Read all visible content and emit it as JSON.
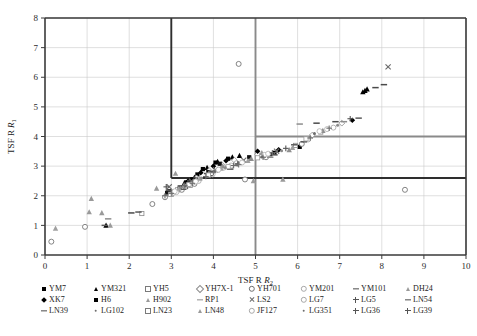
{
  "chart_data": {
    "type": "scatter",
    "title": "",
    "xlabel": "TSF R",
    "xlabel_sub": "2",
    "ylabel": "TSF R",
    "ylabel_sub": "1",
    "xlim": [
      0,
      10
    ],
    "ylim": [
      0,
      8
    ],
    "xticks": [
      "0",
      "1",
      "2",
      "3",
      "4",
      "5",
      "6",
      "7",
      "8",
      "9",
      "10"
    ],
    "yticks": [
      "0",
      "1",
      "2",
      "3",
      "4",
      "5",
      "6",
      "7",
      "8"
    ],
    "grid": true,
    "legend_position": "below",
    "reference_lines": {
      "inner_box_x": 3,
      "inner_box_y": 2.6,
      "outer_box_x": 5,
      "outer_box_y": 4
    },
    "series": [
      {
        "name": "YM7",
        "marker": "square-filled",
        "color": "#000000",
        "points": [
          [
            3.5,
            2.55
          ],
          [
            3.62,
            2.72
          ],
          [
            3.75,
            2.9
          ],
          [
            4.05,
            3.12
          ],
          [
            4.35,
            3.25
          ],
          [
            2.95,
            2.15
          ],
          [
            5.45,
            3.45
          ],
          [
            6.05,
            3.65
          ],
          [
            3.35,
            2.45
          ]
        ]
      },
      {
        "name": "YM321",
        "marker": "triangle-filled",
        "color": "#000000",
        "points": [
          [
            1.45,
            1.0
          ],
          [
            3.3,
            2.4
          ],
          [
            3.55,
            2.62
          ],
          [
            3.85,
            2.95
          ],
          [
            4.1,
            3.15
          ],
          [
            4.45,
            3.3
          ],
          [
            4.62,
            3.35
          ],
          [
            7.55,
            5.5
          ],
          [
            7.6,
            5.55
          ],
          [
            7.65,
            5.6
          ]
        ]
      },
      {
        "name": "YH5",
        "marker": "square-open",
        "color": "#8a8a8a",
        "points": [
          [
            2.3,
            1.4
          ],
          [
            3.0,
            2.05
          ],
          [
            3.45,
            2.35
          ],
          [
            5.95,
            3.7
          ],
          [
            6.55,
            4.15
          ],
          [
            3.15,
            2.2
          ]
        ]
      },
      {
        "name": "YH7X-1",
        "marker": "diamond-open",
        "color": "#8c8c8c",
        "points": [
          [
            3.6,
            2.6
          ],
          [
            3.9,
            2.85
          ],
          [
            4.2,
            3.05
          ],
          [
            4.5,
            3.2
          ],
          [
            5.05,
            3.4
          ],
          [
            7.05,
            4.45
          ],
          [
            6.35,
            4.05
          ]
        ]
      },
      {
        "name": "YH701",
        "marker": "circle-open",
        "color": "#6f6f6f",
        "points": [
          [
            0.95,
            0.95
          ],
          [
            2.55,
            1.72
          ],
          [
            2.85,
            1.95
          ],
          [
            3.25,
            2.2
          ],
          [
            3.55,
            2.4
          ],
          [
            4.6,
            6.45
          ],
          [
            4.75,
            2.55
          ],
          [
            5.25,
            3.3
          ],
          [
            6.1,
            3.75
          ],
          [
            8.55,
            2.2
          ],
          [
            0.15,
            0.45
          ]
        ]
      },
      {
        "name": "YM201",
        "marker": "circle-light",
        "color": "#a8a8a8",
        "points": [
          [
            3.05,
            2.1
          ],
          [
            3.35,
            2.3
          ],
          [
            3.65,
            2.5
          ],
          [
            3.95,
            2.75
          ],
          [
            4.25,
            2.95
          ],
          [
            4.55,
            3.1
          ],
          [
            5.15,
            3.35
          ],
          [
            6.25,
            3.9
          ],
          [
            6.85,
            4.3
          ]
        ]
      },
      {
        "name": "YM101",
        "marker": "dash",
        "color": "#4a4a4a",
        "points": [
          [
            2.05,
            1.42
          ],
          [
            3.85,
            2.75
          ],
          [
            4.4,
            2.9
          ],
          [
            6.45,
            4.45
          ],
          [
            6.9,
            4.5
          ],
          [
            7.85,
            5.65
          ],
          [
            8.05,
            5.75
          ]
        ]
      },
      {
        "name": "DH24",
        "marker": "triangle-gray",
        "color": "#9a9a9a",
        "points": [
          [
            1.05,
            1.45
          ],
          [
            1.1,
            1.9
          ],
          [
            1.35,
            1.42
          ],
          [
            1.55,
            1.0
          ],
          [
            2.65,
            2.25
          ],
          [
            3.1,
            2.75
          ],
          [
            4.95,
            2.5
          ],
          [
            5.65,
            2.55
          ],
          [
            5.15,
            3.45
          ]
        ]
      },
      {
        "name": "XK7",
        "marker": "diamond-filled",
        "color": "#000000",
        "points": [
          [
            3.4,
            2.5
          ],
          [
            3.7,
            2.78
          ],
          [
            4.0,
            3.0
          ],
          [
            4.3,
            3.18
          ],
          [
            5.05,
            3.5
          ],
          [
            5.55,
            3.55
          ],
          [
            7.3,
            4.55
          ]
        ]
      },
      {
        "name": "H6",
        "marker": "square-filled",
        "color": "#111111",
        "points": [
          [
            2.9,
            2.1
          ],
          [
            3.2,
            2.28
          ],
          [
            3.58,
            2.55
          ],
          [
            3.88,
            2.8
          ],
          [
            4.15,
            3.08
          ],
          [
            4.85,
            3.3
          ],
          [
            5.35,
            3.4
          ]
        ]
      },
      {
        "name": "H902",
        "marker": "triangle-gray",
        "color": "#8f8f8f",
        "points": [
          [
            3.3,
            2.35
          ],
          [
            3.6,
            2.55
          ],
          [
            3.9,
            2.78
          ],
          [
            4.22,
            3.0
          ],
          [
            4.9,
            3.25
          ],
          [
            5.8,
            3.55
          ],
          [
            6.6,
            4.2
          ]
        ]
      },
      {
        "name": "RP1",
        "marker": "dash-gray",
        "color": "#8d8d8d",
        "points": [
          [
            1.5,
            1.22
          ],
          [
            2.92,
            2.02
          ],
          [
            3.42,
            2.42
          ],
          [
            5.35,
            3.3
          ],
          [
            6.05,
            4.42
          ],
          [
            7.1,
            4.5
          ]
        ]
      },
      {
        "name": "LS2",
        "marker": "x-mark",
        "color": "#6a6a6a",
        "points": [
          [
            2.95,
            2.3
          ],
          [
            3.48,
            2.48
          ],
          [
            4.05,
            2.88
          ],
          [
            4.72,
            3.2
          ],
          [
            5.5,
            3.5
          ],
          [
            8.15,
            6.35
          ]
        ]
      },
      {
        "name": "LG7",
        "marker": "circle-light",
        "color": "#b0b0b0",
        "points": [
          [
            3.12,
            2.12
          ],
          [
            3.52,
            2.45
          ],
          [
            3.98,
            2.72
          ],
          [
            4.42,
            3.02
          ],
          [
            5.22,
            3.38
          ],
          [
            6.7,
            4.25
          ]
        ]
      },
      {
        "name": "LG5",
        "marker": "plus",
        "color": "#555555",
        "points": [
          [
            2.88,
            2.3
          ],
          [
            3.38,
            2.32
          ],
          [
            3.92,
            2.68
          ],
          [
            4.58,
            3.08
          ],
          [
            5.72,
            3.6
          ],
          [
            7.25,
            4.6
          ]
        ]
      },
      {
        "name": "LN54",
        "marker": "dash",
        "color": "#5a5a5a",
        "points": [
          [
            1.42,
            1.0
          ],
          [
            2.22,
            1.45
          ],
          [
            3.28,
            2.22
          ],
          [
            4.08,
            2.82
          ],
          [
            5.92,
            3.72
          ],
          [
            7.45,
            4.62
          ]
        ]
      },
      {
        "name": "LN39",
        "marker": "dash",
        "color": "#555555",
        "points": [
          [
            2.95,
            2.18
          ],
          [
            3.45,
            2.5
          ],
          [
            3.98,
            2.82
          ],
          [
            4.65,
            3.12
          ],
          [
            5.45,
            3.38
          ],
          [
            6.15,
            3.82
          ]
        ]
      },
      {
        "name": "LG102",
        "marker": "dot-small",
        "color": "#6e6e6e",
        "points": [
          [
            3.05,
            2.18
          ],
          [
            3.55,
            2.52
          ],
          [
            4.05,
            2.85
          ],
          [
            4.55,
            3.05
          ],
          [
            5.15,
            3.32
          ],
          [
            6.4,
            4.1
          ]
        ]
      },
      {
        "name": "LN23",
        "marker": "square-open",
        "color": "#9b9b9b",
        "points": [
          [
            2.98,
            2.05
          ],
          [
            3.42,
            2.38
          ],
          [
            3.88,
            2.7
          ],
          [
            4.35,
            2.98
          ],
          [
            5.05,
            3.28
          ],
          [
            6.2,
            3.92
          ]
        ]
      },
      {
        "name": "LN48",
        "marker": "triangle-gray",
        "color": "#a0a0a0",
        "points": [
          [
            0.25,
            0.9
          ],
          [
            3.18,
            2.25
          ],
          [
            3.68,
            2.58
          ],
          [
            4.18,
            2.92
          ],
          [
            4.82,
            3.18
          ],
          [
            5.88,
            3.62
          ]
        ]
      },
      {
        "name": "JF127",
        "marker": "circle-light",
        "color": "#b5b5b5",
        "points": [
          [
            3.08,
            2.15
          ],
          [
            3.58,
            2.48
          ],
          [
            4.12,
            2.88
          ],
          [
            4.68,
            3.12
          ],
          [
            5.3,
            3.42
          ],
          [
            6.52,
            4.18
          ]
        ]
      },
      {
        "name": "LG351",
        "marker": "dot-small",
        "color": "#8a8a8a",
        "points": [
          [
            3.22,
            2.28
          ],
          [
            3.72,
            2.6
          ],
          [
            4.28,
            2.95
          ],
          [
            4.88,
            3.22
          ],
          [
            5.62,
            3.52
          ],
          [
            6.95,
            4.38
          ]
        ]
      },
      {
        "name": "LG36",
        "marker": "plus",
        "color": "#6b6b6b",
        "points": [
          [
            2.85,
            2.0
          ],
          [
            3.32,
            2.35
          ],
          [
            3.82,
            2.65
          ],
          [
            4.48,
            3.02
          ],
          [
            5.18,
            3.3
          ],
          [
            6.3,
            3.95
          ]
        ]
      },
      {
        "name": "LG39",
        "marker": "plus",
        "color": "#707070",
        "points": [
          [
            3.0,
            2.08
          ],
          [
            3.5,
            2.42
          ],
          [
            4.0,
            2.78
          ],
          [
            4.6,
            3.05
          ],
          [
            5.4,
            3.45
          ],
          [
            6.75,
            4.28
          ]
        ]
      }
    ]
  },
  "legend": {
    "rows": [
      [
        {
          "label": "YM7",
          "marker": "square-filled"
        },
        {
          "label": "YM321",
          "marker": "triangle-filled"
        },
        {
          "label": "YH5",
          "marker": "square-open"
        },
        {
          "label": "YH7X-1",
          "marker": "diamond-open"
        },
        {
          "label": "YH701",
          "marker": "circle-open"
        },
        {
          "label": "YM201",
          "marker": "circle-light"
        },
        {
          "label": "YM101",
          "marker": "dash"
        },
        {
          "label": "DH24",
          "marker": "triangle-gray"
        }
      ],
      [
        {
          "label": "XK7",
          "marker": "diamond-filled"
        },
        {
          "label": "H6",
          "marker": "square-filled"
        },
        {
          "label": "H902",
          "marker": "triangle-gray"
        },
        {
          "label": "RP1",
          "marker": "dash-gray"
        },
        {
          "label": "LS2",
          "marker": "x-mark"
        },
        {
          "label": "LG7",
          "marker": "circle-light"
        },
        {
          "label": "LG5",
          "marker": "plus"
        },
        {
          "label": "LN54",
          "marker": "dash"
        }
      ],
      [
        {
          "label": "LN39",
          "marker": "dash"
        },
        {
          "label": "LG102",
          "marker": "dot-small"
        },
        {
          "label": "LN23",
          "marker": "square-open"
        },
        {
          "label": "LN48",
          "marker": "triangle-gray"
        },
        {
          "label": "JF127",
          "marker": "circle-light"
        },
        {
          "label": "LG351",
          "marker": "dot-small"
        },
        {
          "label": "LG36",
          "marker": "plus"
        },
        {
          "label": "LG39",
          "marker": "plus"
        }
      ]
    ]
  },
  "colors": {
    "axis": "#3a3a3a",
    "grid": "#c9c9c9",
    "inner_box": "#2e2e2e",
    "outer_box": "#8a8a8a",
    "text": "#1c1c1c"
  }
}
